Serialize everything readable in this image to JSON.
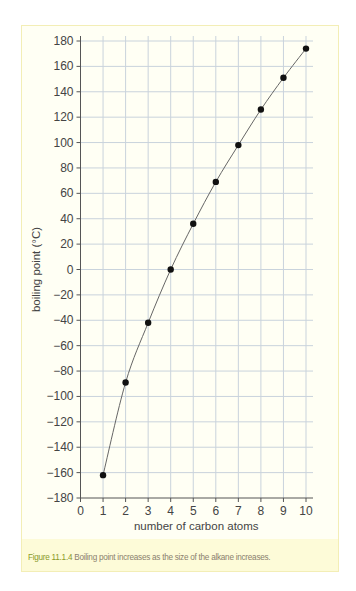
{
  "chart_data": {
    "type": "line",
    "title": "",
    "xlabel": "number of carbon atoms",
    "ylabel": "boiling point (°C)",
    "x": [
      1,
      2,
      3,
      4,
      5,
      6,
      7,
      8,
      9,
      10
    ],
    "series": [
      {
        "name": "alkane boiling point",
        "values": [
          -162,
          -89,
          -42,
          0,
          36,
          69,
          98,
          126,
          151,
          174
        ]
      }
    ],
    "xlim": [
      0,
      10
    ],
    "ylim": [
      -180,
      180
    ],
    "xticks": [
      "0",
      "1",
      "2",
      "3",
      "4",
      "5",
      "6",
      "7",
      "8",
      "9",
      "10"
    ],
    "yticks": [
      "180",
      "160",
      "140",
      "120",
      "100",
      "80",
      "60",
      "40",
      "20",
      "0",
      "-20",
      "-40",
      "-60",
      "-80",
      "-100",
      "-120",
      "-140",
      "-160",
      "-180"
    ],
    "grid": true,
    "markers": "filled-circle",
    "line": "smooth curve through points",
    "legend": "none"
  },
  "caption": {
    "label": "Figure 11.1.4",
    "text": " Boiling point increases as the size of the alkane increases."
  },
  "colors": {
    "frame_border": "#f3eeb6",
    "frame_bg": "#fffff4",
    "caption_bg": "#fdfbd8",
    "caption_label": "#8a9a2a",
    "caption_text": "#8b7f6e",
    "grid": "#c9d3dc",
    "axis": "#555555",
    "curve": "#666666",
    "marker": "#111111"
  }
}
